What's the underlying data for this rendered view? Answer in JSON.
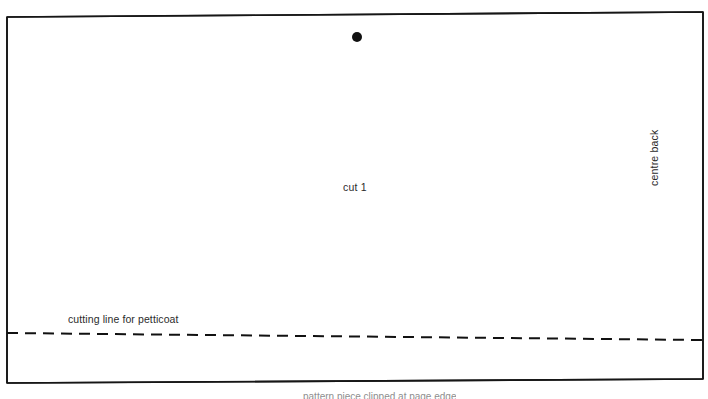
{
  "sheet": {
    "width": 708,
    "height": 399,
    "background_color": "#ffffff",
    "ink_color": "#1a1a1a"
  },
  "pattern_piece": {
    "name": "bodice-pattern-piece",
    "outline_color": "#1a1a1a",
    "outline_width": 1.6,
    "corners": {
      "top_left": [
        7,
        17
      ],
      "top_right": [
        703,
        12
      ],
      "bottom_right": [
        703,
        379
      ],
      "bottom_left": [
        7,
        383
      ]
    }
  },
  "markings": {
    "dot": {
      "label": "pattern-dot-marker",
      "x": 357,
      "y": 37,
      "radius": 5,
      "color": "#111111"
    },
    "cut_instruction": "cut 1",
    "centre_back": "centre back",
    "cutting_line_label": "cutting line for petticoat",
    "cutting_line": {
      "start": [
        7,
        333
      ],
      "end": [
        703,
        340
      ],
      "style": "dashed",
      "dash": "11 7",
      "color": "#111111",
      "width": 2
    }
  },
  "bottom_caption": {
    "text": "pattern piece clipped at page edge",
    "visible": "partially clipped"
  }
}
